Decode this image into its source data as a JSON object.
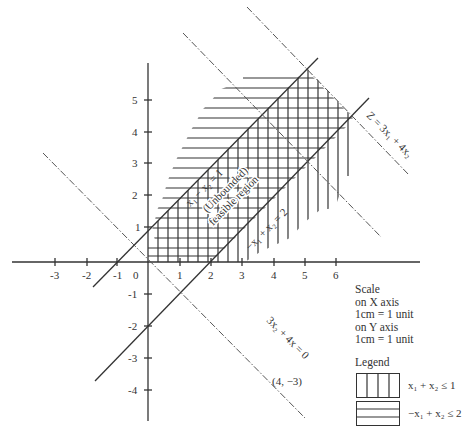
{
  "diagram": {
    "type": "linear-programming-graph",
    "x_axis": {
      "ticks": [
        "-3",
        "-2",
        "-1",
        "0",
        "1",
        "2",
        "3",
        "4",
        "5",
        "6"
      ]
    },
    "y_axis": {
      "ticks": [
        "5",
        "4",
        "3",
        "2",
        "1",
        "-1",
        "-2",
        "-3",
        "-4"
      ]
    },
    "lines": {
      "line_a_label": "x₁ − x₂ = 1",
      "line_b_label": "−x₁ + x₂ = 2",
      "objective_label": "Z = 3x₁ + 4x₂",
      "iso_zero_label": "3x₂ + 4x = 0",
      "point_label": "(4, −3)"
    },
    "region_label_line1": "(Unbounded)",
    "region_label_line2": "feasible region"
  },
  "scale": {
    "title": "Scale",
    "x_line": "on X axis",
    "x_value": "1cm = 1 unit",
    "y_line": "on Y axis",
    "y_value": "1cm = 1 unit"
  },
  "legend": {
    "title": "Legend",
    "items": [
      {
        "pattern": "vertical",
        "label": "x₁ + x₂ ≤ 1"
      },
      {
        "pattern": "horizontal",
        "label": "−x₁ + x₂ ≤ 2"
      }
    ]
  }
}
